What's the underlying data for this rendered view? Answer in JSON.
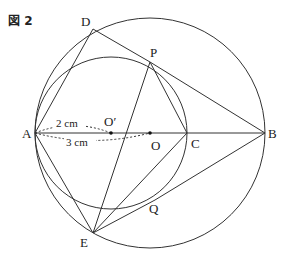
{
  "figure_label": "図 2",
  "points": {
    "A": "A",
    "B": "B",
    "C": "C",
    "D": "D",
    "E": "E",
    "O": "O",
    "O_prime": "O′",
    "P": "P",
    "Q": "Q"
  },
  "measures": {
    "AO_prime": "2 cm",
    "AO": "3 cm"
  },
  "colors": {
    "line": "#333333"
  }
}
